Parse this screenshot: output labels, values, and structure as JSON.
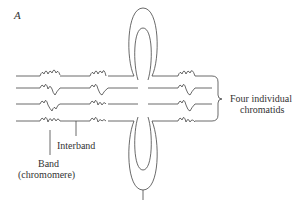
{
  "figure": {
    "panel_label": "A",
    "labels": {
      "four_individual": "Four individual",
      "chromatids": "chromatids",
      "interband": "Interband",
      "band": "Band",
      "chromomere": "(chromomere)"
    },
    "colors": {
      "stroke": "#444444",
      "background": "#ffffff",
      "text": "#333333"
    },
    "structure": {
      "chromatid_count": 4,
      "band_groups": 3,
      "central_loop": "lampbrush loop pair (top and bottom)"
    }
  }
}
